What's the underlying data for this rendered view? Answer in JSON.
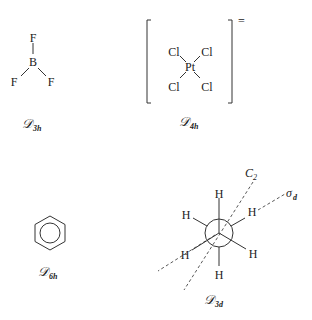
{
  "molecules": [
    {
      "name": "BF3",
      "atoms": {
        "center": "B",
        "ligands": [
          "F",
          "F",
          "F"
        ]
      },
      "point_group": {
        "script": "𝒟",
        "subscript": "3h"
      }
    },
    {
      "name": "PtCl4",
      "atoms": {
        "center": "Pt",
        "ligands": [
          "Cl",
          "Cl",
          "Cl",
          "Cl"
        ]
      },
      "charge": "=",
      "point_group": {
        "script": "𝒟",
        "subscript": "4h"
      }
    },
    {
      "name": "benzene",
      "point_group": {
        "script": "𝒟",
        "subscript": "6h"
      }
    },
    {
      "name": "ethane-staggered",
      "atoms": {
        "hydrogens": [
          "H",
          "H",
          "H",
          "H",
          "H",
          "H"
        ]
      },
      "axes": {
        "c2": "C",
        "c2_sub": "2",
        "sigma": "σ",
        "sigma_sub": "d"
      },
      "point_group": {
        "script": "𝒟",
        "subscript": "3d"
      }
    }
  ]
}
